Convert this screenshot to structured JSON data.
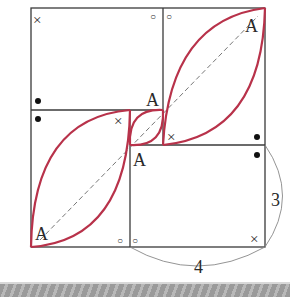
{
  "diagram": {
    "colors": {
      "line": "#3a3a3a",
      "arc": "#b8324a",
      "dashed": "#777777",
      "band": "#a8a8a8"
    },
    "labels": {
      "vertex_top_right": "A",
      "vertex_center_upper": "A",
      "vertex_center_lower": "A",
      "vertex_bottom_left": "A",
      "dim_height": "3",
      "dim_width": "4"
    },
    "angle_marks": {
      "cross": "×",
      "circle": "○",
      "dot": "●"
    }
  }
}
